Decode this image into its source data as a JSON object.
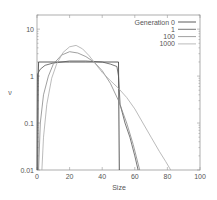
{
  "chart_data": {
    "type": "line",
    "title": "",
    "xlabel": "Size",
    "ylabel": "ν",
    "xlim": [
      0,
      100
    ],
    "ylim": [
      0.01,
      20
    ],
    "yscale": "log",
    "grid": false,
    "legend_position": "top-right",
    "x_ticks": [
      0,
      20,
      40,
      60,
      80,
      100
    ],
    "y_ticks": [
      0.01,
      0.1,
      1,
      10
    ],
    "y_tick_labels": [
      "0.01",
      "0.1",
      "1",
      "10"
    ],
    "series": [
      {
        "name": "Generation 0",
        "color": "#333333",
        "dash": "",
        "points": [
          [
            0.5,
            0.01
          ],
          [
            0.8,
            1.2
          ],
          [
            1,
            2
          ],
          [
            10,
            2
          ],
          [
            20,
            2
          ],
          [
            30,
            2
          ],
          [
            40,
            2
          ],
          [
            50,
            2
          ],
          [
            50.5,
            0.01
          ]
        ]
      },
      {
        "name": "1",
        "color": "#555555",
        "dash": "",
        "points": [
          [
            0,
            0.01
          ],
          [
            0.3,
            1.1
          ],
          [
            2,
            1.4
          ],
          [
            5,
            1.7
          ],
          [
            10,
            1.9
          ],
          [
            20,
            2.1
          ],
          [
            30,
            2.1
          ],
          [
            40,
            2.0
          ],
          [
            45,
            1.8
          ],
          [
            49,
            1.6
          ],
          [
            50,
            1.0
          ],
          [
            51,
            0.25
          ],
          [
            54,
            0.1
          ],
          [
            57,
            0.05
          ],
          [
            60,
            0.02
          ],
          [
            62,
            0.01
          ]
        ]
      },
      {
        "name": "100",
        "color": "#888888",
        "dash": "",
        "points": [
          [
            1,
            0.01
          ],
          [
            2,
            0.1
          ],
          [
            4,
            0.4
          ],
          [
            7,
            1.0
          ],
          [
            10,
            1.8
          ],
          [
            15,
            2.8
          ],
          [
            20,
            3.3
          ],
          [
            25,
            3.1
          ],
          [
            30,
            2.6
          ],
          [
            35,
            2.0
          ],
          [
            40,
            1.3
          ],
          [
            45,
            0.7
          ],
          [
            50,
            0.3
          ],
          [
            55,
            0.1
          ],
          [
            59,
            0.035
          ],
          [
            63,
            0.01
          ]
        ]
      },
      {
        "name": "1000",
        "color": "#aaaaaa",
        "dash": "",
        "points": [
          [
            3,
            0.01
          ],
          [
            4,
            0.05
          ],
          [
            6,
            0.25
          ],
          [
            9,
            0.9
          ],
          [
            12,
            1.8
          ],
          [
            16,
            3.2
          ],
          [
            20,
            4.2
          ],
          [
            24,
            4.5
          ],
          [
            28,
            3.8
          ],
          [
            32,
            2.7
          ],
          [
            36,
            1.8
          ],
          [
            40,
            1.2
          ],
          [
            45,
            0.8
          ],
          [
            50,
            0.55
          ],
          [
            55,
            0.35
          ],
          [
            60,
            0.2
          ],
          [
            65,
            0.1
          ],
          [
            70,
            0.05
          ],
          [
            75,
            0.025
          ],
          [
            79,
            0.015
          ],
          [
            82,
            0.01
          ]
        ]
      }
    ]
  }
}
